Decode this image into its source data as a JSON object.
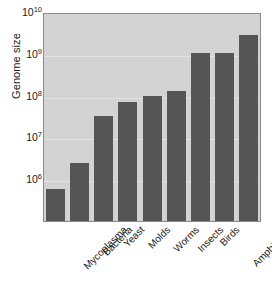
{
  "chart_data": {
    "type": "bar",
    "title": "",
    "xlabel": "",
    "ylabel": "Genome size",
    "yscale": "log",
    "ylim": [
      100000,
      10000000000
    ],
    "grid": true,
    "legend": null,
    "categories": [
      "Mycoplasma",
      "Bacteria",
      "Yeast",
      "Molds",
      "Worms",
      "Insects",
      "Birds",
      "Amphibians",
      "Mammals"
    ],
    "values": [
      600000,
      2500000,
      33000000,
      70000000,
      100000000,
      130000000,
      1050000000,
      1050000000,
      2800000000
    ],
    "ytick_labels": [
      "10¹⁰",
      "10⁹",
      "10⁸",
      "10⁷",
      "10⁶"
    ],
    "ytick_values": [
      10000000000,
      1000000000,
      100000000,
      10000000,
      1000000
    ],
    "ytick_bases": [
      "10",
      "10",
      "10",
      "10",
      "10"
    ],
    "ytick_exponents": [
      "10",
      "9",
      "8",
      "7",
      "6"
    ],
    "colors": {
      "bar": "#555555",
      "plot_background": "#d3d3d3",
      "gridline": "#e2e2e2",
      "axis": "#8a8a8a",
      "text": "#1a1a1a",
      "figure_background": "#ffffff"
    }
  }
}
